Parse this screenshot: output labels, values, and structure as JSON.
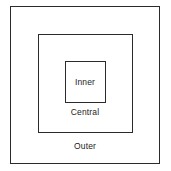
{
  "diagram": {
    "background_color": "#ffffff",
    "stroke_color": "#2b2b2b",
    "text_color": "#1c1c1c",
    "regions": [
      {
        "id": "outer",
        "label": "Outer",
        "level": 1,
        "shape": "rectangle"
      },
      {
        "id": "central",
        "label": "Central",
        "level": 2,
        "shape": "rectangle"
      },
      {
        "id": "inner",
        "label": "Inner",
        "level": 3,
        "shape": "rectangle"
      }
    ]
  }
}
